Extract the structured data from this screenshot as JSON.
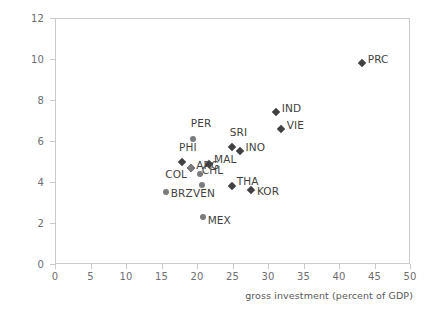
{
  "chart_data": {
    "type": "scatter",
    "title": "",
    "xlabel": "gross investment (percent of GDP)",
    "ylabel": "",
    "xlim": [
      0,
      50
    ],
    "ylim": [
      0,
      12
    ],
    "xticks": [
      "0",
      "5",
      "10",
      "15",
      "20",
      "25",
      "30",
      "35",
      "40",
      "45",
      "50"
    ],
    "yticks": [
      "0",
      "2",
      "4",
      "6",
      "8",
      "10",
      "12"
    ],
    "grid": false,
    "legend": "none",
    "marker_colors": {
      "diamond": "#414042",
      "circle": "#7b7c7e"
    },
    "points": [
      {
        "label": "PRC",
        "x": 43.2,
        "y": 9.8,
        "marker": "diamond",
        "label_dx": 6,
        "label_dy": -4
      },
      {
        "label": "IND",
        "x": 31.1,
        "y": 7.4,
        "marker": "diamond",
        "label_dx": 6,
        "label_dy": -4
      },
      {
        "label": "VIE",
        "x": 31.8,
        "y": 6.6,
        "marker": "diamond",
        "label_dx": 6,
        "label_dy": -4
      },
      {
        "label": "SRI",
        "x": 24.9,
        "y": 5.7,
        "marker": "diamond",
        "label_dx": -2,
        "label_dy": -15
      },
      {
        "label": "INO",
        "x": 26.0,
        "y": 5.5,
        "marker": "diamond",
        "label_dx": 6,
        "label_dy": -4
      },
      {
        "label": "PER",
        "x": 19.4,
        "y": 6.1,
        "marker": "circle",
        "label_dx": -2,
        "label_dy": -16
      },
      {
        "label": "PHI",
        "x": 17.9,
        "y": 5.0,
        "marker": "diamond",
        "label_dx": -3,
        "label_dy": -15
      },
      {
        "label": "MAL",
        "x": 21.7,
        "y": 4.9,
        "marker": "diamond",
        "label_dx": 5,
        "label_dy": -5
      },
      {
        "label": "ARG",
        "x": 19.2,
        "y": 4.7,
        "marker": "diamond",
        "label_dx": 5,
        "label_dy": -3
      },
      {
        "label": "COL",
        "x": 19.2,
        "y": 4.7,
        "marker": "circle",
        "label_dx": -26,
        "label_dy": 6
      },
      {
        "label": "CHL",
        "x": 20.4,
        "y": 4.4,
        "marker": "circle",
        "label_dx": 2,
        "label_dy": -4
      },
      {
        "label": "VEN",
        "x": 20.7,
        "y": 3.85,
        "marker": "circle",
        "label_dx": -9,
        "label_dy": 8
      },
      {
        "label": "THA",
        "x": 24.9,
        "y": 3.8,
        "marker": "diamond",
        "label_dx": 5,
        "label_dy": -5
      },
      {
        "label": "KOR",
        "x": 27.6,
        "y": 3.6,
        "marker": "diamond",
        "label_dx": 6,
        "label_dy": 1
      },
      {
        "label": "BRZ",
        "x": 15.6,
        "y": 3.5,
        "marker": "circle",
        "label_dx": 5,
        "label_dy": 1
      },
      {
        "label": "MEX",
        "x": 20.8,
        "y": 2.3,
        "marker": "circle",
        "label_dx": 5,
        "label_dy": 3
      }
    ]
  },
  "figure": {
    "xaxis_title": "gross investment (percent of GDP)",
    "yaxis_title": ""
  }
}
